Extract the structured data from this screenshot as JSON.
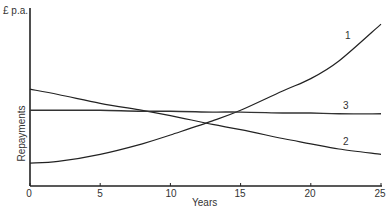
{
  "chart_data": {
    "type": "line",
    "title": "",
    "xlabel": "Years",
    "ylabel": "Repayments",
    "y_unit_label": "£ p.a.",
    "xlim": [
      0,
      25
    ],
    "ylim": [
      0,
      100
    ],
    "x_ticks": [
      "0",
      "5",
      "10",
      "15",
      "20",
      "25"
    ],
    "y_ticks": [],
    "grid": false,
    "legend": "inline labels at line ends",
    "x": [
      0,
      2,
      5,
      8,
      10,
      13,
      15,
      18,
      20,
      22,
      25
    ],
    "series": [
      {
        "name": "1",
        "values": [
          13,
          14,
          18,
          24,
          29,
          37,
          43,
          54,
          61,
          71,
          92
        ]
      },
      {
        "name": "2",
        "values": [
          55,
          52,
          47,
          43,
          40,
          35,
          32,
          27,
          24,
          21,
          18
        ]
      },
      {
        "name": "3",
        "values": [
          43,
          43,
          43,
          42.5,
          42.5,
          42,
          42,
          41.5,
          41.5,
          41,
          41
        ]
      }
    ],
    "annotations": [
      {
        "text": "1",
        "series": "1"
      },
      {
        "text": "2",
        "series": "2"
      },
      {
        "text": "3",
        "series": "3"
      }
    ]
  },
  "labels": {
    "y_unit": "£ p.a.",
    "y_axis": "Repayments",
    "x_axis": "Years",
    "ticks": [
      "0",
      "5",
      "10",
      "15",
      "20",
      "25"
    ],
    "series_1": "1",
    "series_2": "2",
    "series_3": "3"
  }
}
